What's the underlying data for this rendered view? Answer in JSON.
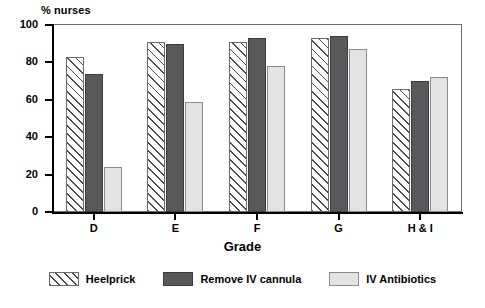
{
  "chart_data": {
    "type": "bar",
    "title": "",
    "subtitle": "",
    "xlabel": "Grade",
    "ylabel": "% nurses",
    "categories": [
      "D",
      "E",
      "F",
      "G",
      "H & I"
    ],
    "series": [
      {
        "name": "Heelprick",
        "values": [
          83,
          91,
          91,
          93,
          66
        ],
        "pattern": "diagonal-hatch",
        "color": "#ffffff"
      },
      {
        "name": "Remove IV cannula",
        "values": [
          74,
          90,
          93,
          94,
          70
        ],
        "pattern": "solid",
        "color": "#59595b"
      },
      {
        "name": "IV Antibiotics",
        "values": [
          24,
          59,
          78,
          87,
          72
        ],
        "pattern": "solid",
        "color": "#e3e3e3"
      }
    ],
    "ylim": [
      0,
      100
    ],
    "yticks": [
      0,
      20,
      40,
      60,
      80,
      100
    ],
    "ytick_labels": [
      "0",
      "20",
      "40",
      "60",
      "80",
      "100"
    ],
    "grid": false,
    "legend_position": "bottom",
    "legend_entries": [
      "Heelprick",
      "Remove IV cannula",
      "IV Antibiotics"
    ]
  }
}
